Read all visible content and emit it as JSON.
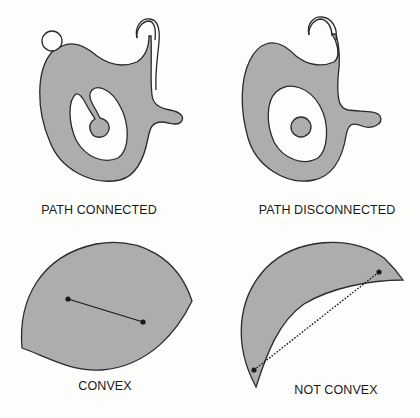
{
  "figure": {
    "colors": {
      "fill": "#adadad",
      "stroke": "#2a2a2a",
      "background": "#fdfdfb"
    },
    "panels": [
      {
        "id": "path-connected",
        "caption": "PATH CONNECTED",
        "description": "Shaded region with a hole containing a protruding peninsula; circle touching top-left; curl at top-right"
      },
      {
        "id": "path-disconnected",
        "caption": "PATH DISCONNECTED",
        "description": "Shaded region with a hole containing a separate isolated disk"
      },
      {
        "id": "convex",
        "caption": "CONVEX",
        "description": "Lens-shaped region with a solid segment joining two interior points"
      },
      {
        "id": "not-convex",
        "caption": "NOT CONVEX",
        "description": "Crescent-shaped region with a dotted segment between two points that leaves the region"
      }
    ]
  }
}
